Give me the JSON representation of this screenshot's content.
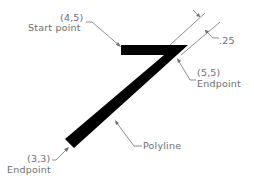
{
  "diagram": {
    "colors": {
      "polyline": "#000000",
      "annotation": "#6e6e6e",
      "background": "#ffffff"
    },
    "labels": {
      "start_coord": "(4,5)",
      "start_text": "Start point",
      "mid_coord": "(5,5)",
      "mid_text": "Endpoint",
      "end_coord": "(3,3)",
      "end_text": "Endpoint",
      "width_dim": ".25",
      "polyline_text": "Polyline"
    },
    "points": [
      {
        "name": "start",
        "coord": "(4,5)",
        "role": "Start point"
      },
      {
        "name": "vertex",
        "coord": "(5,5)",
        "role": "Endpoint"
      },
      {
        "name": "end",
        "coord": "(3,3)",
        "role": "Endpoint"
      }
    ],
    "width": ".25"
  }
}
